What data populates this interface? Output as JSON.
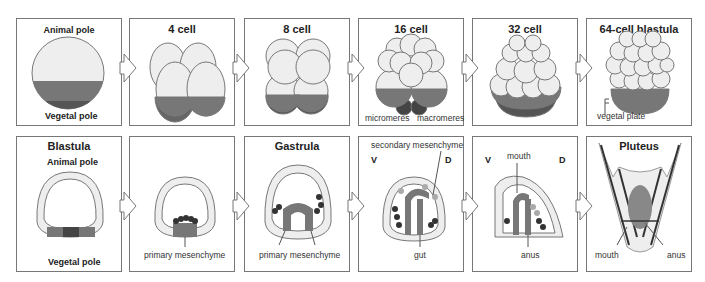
{
  "top_row": [
    {
      "id": "egg",
      "title": "Animal pole",
      "bottom_label": "Vegetal pole"
    },
    {
      "id": "4cell",
      "title": "4 cell"
    },
    {
      "id": "8cell",
      "title": "8 cell"
    },
    {
      "id": "16cell",
      "title": "16 cell",
      "labels": [
        "micromeres",
        "macromeres"
      ]
    },
    {
      "id": "32cell",
      "title": "32 cell"
    },
    {
      "id": "64cell",
      "title": "64-cell blastula",
      "labels": [
        "vegetal plate"
      ]
    }
  ],
  "bottom_row": [
    {
      "id": "blastula",
      "title": "Blastula",
      "subtitle": "Animal pole",
      "bottom_label": "Vegetal pole"
    },
    {
      "id": "mesenchyme",
      "labels": [
        "primary mesenchyme"
      ]
    },
    {
      "id": "gastrula",
      "title": "Gastrula",
      "labels": [
        "primary mesenchyme"
      ]
    },
    {
      "id": "late-gastrula",
      "labels": [
        "secondary mesenchyme",
        "V",
        "D",
        "gut"
      ]
    },
    {
      "id": "prism",
      "labels": [
        "mouth",
        "V",
        "D",
        "anus"
      ]
    },
    {
      "id": "pluteus",
      "title": "Pluteus",
      "labels": [
        "mouth",
        "anus"
      ]
    }
  ],
  "colors": {
    "cell": "#eeeeee",
    "vegetal": "#777777",
    "dark": "#444444",
    "line": "#777777"
  }
}
